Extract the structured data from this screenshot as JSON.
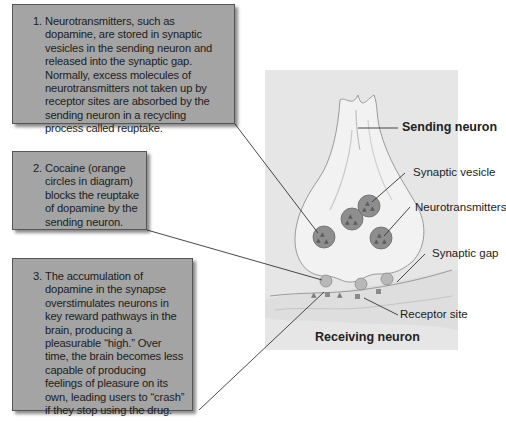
{
  "callouts": [
    {
      "number": "1.",
      "text": "Neurotransmitters, such as dopamine, are stored in synaptic vesicles in the sending neuron and released into the synaptic gap. Normally, excess molecules of neurotransmitters not taken up by receptor sites are absorbed by the sending neuron in a recycling process called reuptake."
    },
    {
      "number": "2.",
      "text": "Cocaine (orange circles in diagram) blocks the reuptake of dopamine by the sending neuron."
    },
    {
      "number": "3.",
      "text": "The accumulation of dopamine in the synapse overstimulates neurons in key reward pathways in the  brain, producing a pleasurable “high.” Over time, the brain becomes less capable of producing feelings of pleasure on its own, leading users to “crash” if they stop using the drug."
    }
  ],
  "labels": {
    "sending_neuron": "Sending neuron",
    "synaptic_vesicle": "Synaptic vesicle",
    "neurotransmitters": "Neurotransmitters",
    "synaptic_gap": "Synaptic gap",
    "receptor_site": "Receptor site",
    "receiving_neuron": "Receiving neuron"
  },
  "colors": {
    "callout_bg": "#a4a4a4",
    "panel_bg": "#e6e6e6",
    "vesicle": "#8e8e8e",
    "cocaine_circle": "#b8b8b8",
    "neuron_fill": "#f1f1f1"
  }
}
